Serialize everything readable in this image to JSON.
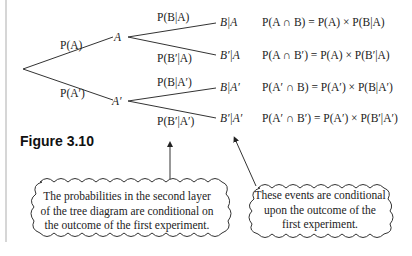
{
  "figure_label": "Figure 3.10",
  "tree": {
    "first_branches": [
      {
        "label": "P(A)",
        "node": "A"
      },
      {
        "label": "P(A′)",
        "node": "A′"
      }
    ],
    "second_branches": [
      {
        "label": "P(B|A)",
        "outcome": "B|A",
        "formula": "P(A ∩ B) = P(A) × P(B|A)"
      },
      {
        "label": "P(B′|A)",
        "outcome": "B′|A",
        "formula": "P(A ∩ B′) = P(A) × P(B′|A)"
      },
      {
        "label": "P(B|A′)",
        "outcome": "B|A′",
        "formula": "P(A′ ∩ B) = P(A′) × P(B|A′)"
      },
      {
        "label": "P(B′|A′)",
        "outcome": "B′|A′",
        "formula": "P(A′ ∩ B′) = P(A′) × P(B′|A′)"
      }
    ]
  },
  "callouts": {
    "left": [
      "The probabilities in the second layer",
      "of the tree diagram are conditional on",
      "the outcome of the first experiment."
    ],
    "right": [
      "These events are conditional",
      "upon the outcome of the",
      "first experiment."
    ]
  }
}
